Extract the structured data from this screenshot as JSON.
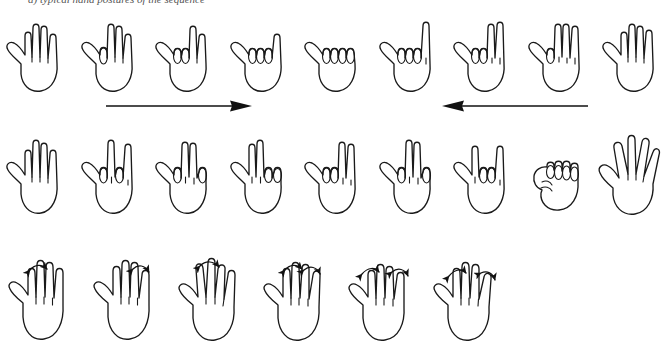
{
  "figure": {
    "caption_partial": "a) typical hand postures of the sequence",
    "background_color": "#ffffff",
    "line_color": "#1a1a1a",
    "width": 671,
    "height": 346
  },
  "rows": [
    {
      "id": "row-1",
      "name": "finger-flexion-sequence-row",
      "count": 9,
      "hands": [
        {
          "name": "hand-open-all-extended",
          "pose": "all four fingers extended",
          "curled": []
        },
        {
          "name": "hand-pinky-curled",
          "pose": "pinky curled, three extended",
          "curled": [
            "pinky"
          ]
        },
        {
          "name": "hand-pinky-ring-curled",
          "pose": "pinky and ring curled",
          "curled": [
            "pinky",
            "ring"
          ]
        },
        {
          "name": "hand-pinky-ring-middle-curled",
          "pose": "pinky, ring and middle curled",
          "curled": [
            "pinky",
            "ring",
            "middle"
          ]
        },
        {
          "name": "hand-all-fingers-curled",
          "pose": "all four fingers curled",
          "curled": [
            "pinky",
            "ring",
            "middle",
            "index"
          ]
        },
        {
          "name": "hand-index-extended",
          "pose": "index extended, others curled",
          "curled": [
            "pinky",
            "ring",
            "middle"
          ]
        },
        {
          "name": "hand-index-middle-extended",
          "pose": "index and middle extended",
          "curled": [
            "pinky",
            "ring"
          ]
        },
        {
          "name": "hand-index-middle-ring-extended",
          "pose": "index, middle and ring extended",
          "curled": [
            "pinky"
          ]
        },
        {
          "name": "hand-open-all-extended-end",
          "pose": "all four fingers extended",
          "curled": []
        }
      ]
    },
    {
      "id": "row-2",
      "name": "individual-finger-combination-row",
      "count": 9,
      "hands": [
        {
          "name": "hand-open-all-extended",
          "pose": "all four fingers extended",
          "curled": []
        },
        {
          "name": "hand-index-ring-curled",
          "pose": "index and ring curled",
          "curled": [
            "index",
            "ring"
          ]
        },
        {
          "name": "hand-middle-pinky-curled",
          "pose": "middle and pinky curled",
          "curled": [
            "middle",
            "pinky"
          ]
        },
        {
          "name": "hand-ring-pinky-curled",
          "pose": "ring and pinky curled",
          "curled": [
            "ring",
            "pinky"
          ]
        },
        {
          "name": "hand-index-middle-curled",
          "pose": "index and middle curled",
          "curled": [
            "index",
            "middle"
          ]
        },
        {
          "name": "hand-index-pinky-curled",
          "pose": "index and pinky curled",
          "curled": [
            "index",
            "pinky"
          ]
        },
        {
          "name": "hand-middle-ring-curled",
          "pose": "middle and ring curled",
          "curled": [
            "middle",
            "ring"
          ]
        },
        {
          "name": "hand-closed-fist",
          "pose": "closed fist",
          "curled": [
            "index",
            "middle",
            "ring",
            "pinky"
          ]
        },
        {
          "name": "hand-open-spread",
          "pose": "open hand, fingers spread apart",
          "curled": []
        }
      ]
    },
    {
      "id": "row-3",
      "name": "finger-abduction-adduction-row",
      "count": 6,
      "hands": [
        {
          "name": "hand-spread-arc-pinky-ring",
          "pose": "abduction arrow between ring and pinky",
          "arcs": [
            "ring-pinky"
          ]
        },
        {
          "name": "hand-spread-arc-index-middle",
          "pose": "abduction arrow between index and middle",
          "arcs": [
            "index-middle"
          ]
        },
        {
          "name": "hand-spread-arc-middle-ring",
          "pose": "abduction arrow between middle and ring",
          "arcs": [
            "middle-ring"
          ]
        },
        {
          "name": "hand-spread-arc-two-gaps",
          "pose": "abduction arrows at two gaps",
          "arcs": [
            "ring-pinky",
            "index-middle"
          ]
        },
        {
          "name": "hand-spread-arc-outer-gaps",
          "pose": "abduction arrows at outer gaps",
          "arcs": [
            "ring-pinky",
            "index-thumbside"
          ]
        },
        {
          "name": "hand-spread-arc-middle-outer",
          "pose": "abduction arrows at middle and outer gaps",
          "arcs": [
            "middle-ring",
            "index-thumbside"
          ]
        }
      ]
    }
  ],
  "arrows": [
    {
      "name": "arrow-right",
      "direction": "right",
      "label": "",
      "length": 142
    },
    {
      "name": "arrow-left",
      "direction": "left",
      "label": "",
      "length": 142
    }
  ]
}
